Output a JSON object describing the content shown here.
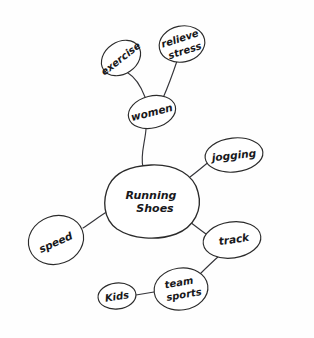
{
  "diagram": {
    "style": "hand-drawn pen sketch on white paper",
    "ink_color": "#2b2b2b",
    "paper_color": "#fefefe"
  },
  "nodes": {
    "center": {
      "id": "running-shoes",
      "label_line1": "Running",
      "label_line2": "Shoes",
      "full_label": "Running Shoes",
      "shape": "blob",
      "cx": 151,
      "cy": 201,
      "rx": 44,
      "ry": 36,
      "rotation": 0
    },
    "women": {
      "id": "women",
      "label_line1": "women",
      "label_line2": "",
      "full_label": "women",
      "shape": "ellipse",
      "cx": 152,
      "cy": 112,
      "rx": 24,
      "ry": 16,
      "rotation": -14
    },
    "exercise": {
      "id": "exercise",
      "label_line1": "exercise",
      "label_line2": "",
      "full_label": "exercise",
      "shape": "ellipse",
      "cx": 121,
      "cy": 58,
      "rx": 21,
      "ry": 16,
      "rotation": -34
    },
    "relieve_stress": {
      "id": "relieve-stress",
      "label_line1": "relieve",
      "label_line2": "stress",
      "full_label": "relieve stress",
      "shape": "ellipse",
      "cx": 182,
      "cy": 44,
      "rx": 23,
      "ry": 18,
      "rotation": -12
    },
    "jogging": {
      "id": "jogging",
      "label_line1": "jogging",
      "label_line2": "",
      "full_label": "jogging",
      "shape": "ellipse",
      "cx": 234,
      "cy": 155,
      "rx": 29,
      "ry": 17,
      "rotation": -6
    },
    "speed": {
      "id": "speed",
      "label_line1": "speed",
      "label_line2": "",
      "full_label": "speed",
      "shape": "ellipse",
      "cx": 56,
      "cy": 240,
      "rx": 28,
      "ry": 24,
      "rotation": -20
    },
    "track": {
      "id": "track",
      "label_line1": "track",
      "label_line2": "",
      "full_label": "track",
      "shape": "ellipse",
      "cx": 232,
      "cy": 240,
      "rx": 29,
      "ry": 18,
      "rotation": -8
    },
    "team_sports": {
      "id": "team-sports",
      "label_line1": "team",
      "label_line2": "sports",
      "full_label": "team sports",
      "shape": "ellipse",
      "cx": 181,
      "cy": 289,
      "rx": 27,
      "ry": 21,
      "rotation": -8
    },
    "kids": {
      "id": "kids",
      "label_line1": "Kids",
      "label_line2": "",
      "full_label": "Kids",
      "shape": "ellipse",
      "cx": 117,
      "cy": 296,
      "rx": 19,
      "ry": 13,
      "rotation": -6
    }
  },
  "edges": [
    {
      "from": "running-shoes",
      "to": "women",
      "path": "M 143 167 C 140 155 145 143 146 129"
    },
    {
      "from": "women",
      "to": "exercise",
      "path": "M 145 97 C 140 84 133 76 128 73"
    },
    {
      "from": "women",
      "to": "relieve-stress",
      "path": "M 163 98 C 170 82 174 70 177 61"
    },
    {
      "from": "running-shoes",
      "to": "jogging",
      "path": "M 190 177 C 198 171 205 165 211 160"
    },
    {
      "from": "running-shoes",
      "to": "speed",
      "path": "M 108 211 C 100 216 92 222 83 228"
    },
    {
      "from": "running-shoes",
      "to": "track",
      "path": "M 186 219 C 194 225 199 229 206 234"
    },
    {
      "from": "track",
      "to": "team-sports",
      "path": "M 219 256 C 211 263 205 269 198 276"
    },
    {
      "from": "team-sports",
      "to": "kids",
      "path": "M 154 292 C 148 293 142 294 136 295"
    }
  ],
  "labels": {
    "center_full": "Running Shoes",
    "branches": [
      "women",
      "jogging",
      "speed",
      "track"
    ],
    "sub_branches": [
      "exercise",
      "relieve stress",
      "team sports",
      "Kids"
    ]
  }
}
